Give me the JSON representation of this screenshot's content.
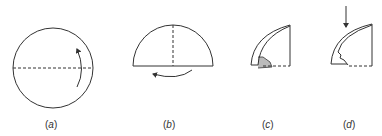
{
  "figure": {
    "panels": [
      {
        "id": "a",
        "label_open": "(",
        "label_letter": "a",
        "label_close": ")",
        "description": "circle with dashed horizontal fold line and curved fold arrow"
      },
      {
        "id": "b",
        "label_open": "(",
        "label_letter": "b",
        "label_close": ")",
        "description": "semicircle with dashed vertical fold line and curved fold arrow"
      },
      {
        "id": "c",
        "label_open": "(",
        "label_letter": "c",
        "label_close": ")",
        "description": "folded quarter cone with shaded corner"
      },
      {
        "id": "d",
        "label_open": "(",
        "label_letter": "d",
        "label_close": ")",
        "description": "folded quarter cone with downward push arrow"
      }
    ],
    "colors": {
      "stroke": "#333333",
      "shade": "#bbbbbb",
      "background": "#ffffff"
    }
  }
}
